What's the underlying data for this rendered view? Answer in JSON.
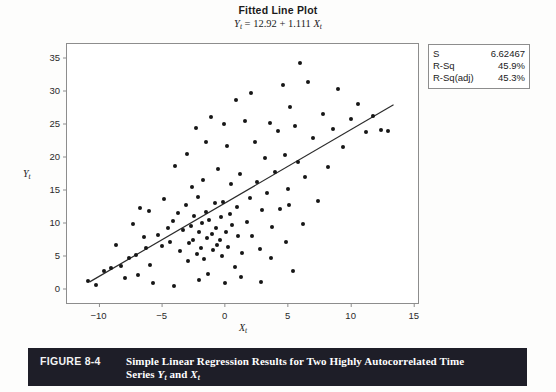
{
  "chart_data": {
    "type": "scatter",
    "title": "Fitted Line Plot",
    "subtitle_equation": "Yₜ = 12.92 + 1.111 Xₜ",
    "equation": {
      "intercept": 12.92,
      "slope": 1.111,
      "response": "Y",
      "predictor": "X",
      "subscript": "t"
    },
    "xlabel": "Xₜ",
    "ylabel": "Yₜ",
    "xlim": [
      -12.5,
      15.5
    ],
    "ylim": [
      -2.5,
      37.0
    ],
    "xticks": [
      -10,
      -5,
      0,
      5,
      10,
      15
    ],
    "yticks": [
      0,
      5,
      10,
      15,
      20,
      25,
      30,
      35
    ],
    "grid": false,
    "legend": "none",
    "fit_line": {
      "x_start": -10.7,
      "y_start": 1.0,
      "x_end": 13.4,
      "y_end": 27.8
    },
    "points": [
      [
        -10.8,
        1.1
      ],
      [
        -10.2,
        0.6
      ],
      [
        -9.6,
        2.6
      ],
      [
        -9.0,
        3.1
      ],
      [
        -8.6,
        6.6
      ],
      [
        -8.2,
        3.4
      ],
      [
        -7.6,
        4.6
      ],
      [
        -7.3,
        9.7
      ],
      [
        -7.0,
        5.1
      ],
      [
        -6.7,
        12.2
      ],
      [
        -6.4,
        7.8
      ],
      [
        -6.2,
        6.2
      ],
      [
        -6.0,
        11.8
      ],
      [
        -5.7,
        0.8
      ],
      [
        -5.3,
        8.1
      ],
      [
        -5.0,
        6.4
      ],
      [
        -4.8,
        13.5
      ],
      [
        -4.5,
        9.2
      ],
      [
        -4.3,
        7.1
      ],
      [
        -4.1,
        10.2
      ],
      [
        -3.9,
        18.6
      ],
      [
        -3.7,
        11.4
      ],
      [
        -3.5,
        5.6
      ],
      [
        -3.3,
        8.8
      ],
      [
        -3.1,
        12.6
      ],
      [
        -3.0,
        20.4
      ],
      [
        -2.9,
        4.1
      ],
      [
        -2.8,
        6.9
      ],
      [
        -2.7,
        9.4
      ],
      [
        -2.6,
        15.3
      ],
      [
        -2.5,
        7.3
      ],
      [
        -2.4,
        11.0
      ],
      [
        -2.3,
        24.3
      ],
      [
        -2.2,
        5.2
      ],
      [
        -2.1,
        13.8
      ],
      [
        -2.0,
        8.5
      ],
      [
        -1.9,
        6.1
      ],
      [
        -1.8,
        9.9
      ],
      [
        -1.7,
        16.4
      ],
      [
        -1.6,
        4.4
      ],
      [
        -1.5,
        11.6
      ],
      [
        -1.4,
        7.6
      ],
      [
        -1.3,
        2.2
      ],
      [
        -1.2,
        10.4
      ],
      [
        -1.1,
        26.0
      ],
      [
        -1.0,
        8.2
      ],
      [
        -0.9,
        5.8
      ],
      [
        -0.8,
        12.9
      ],
      [
        -0.7,
        9.1
      ],
      [
        -0.6,
        6.6
      ],
      [
        -0.5,
        18.1
      ],
      [
        -0.4,
        7.4
      ],
      [
        -0.3,
        10.8
      ],
      [
        -0.2,
        4.9
      ],
      [
        -0.1,
        13.1
      ],
      [
        0.1,
        8.6
      ],
      [
        0.2,
        21.6
      ],
      [
        0.3,
        6.3
      ],
      [
        0.4,
        11.3
      ],
      [
        0.5,
        15.8
      ],
      [
        0.6,
        9.6
      ],
      [
        0.8,
        3.2
      ],
      [
        1.0,
        12.4
      ],
      [
        1.1,
        7.9
      ],
      [
        1.2,
        17.3
      ],
      [
        1.4,
        5.4
      ],
      [
        1.6,
        25.3
      ],
      [
        1.8,
        10.1
      ],
      [
        2.0,
        13.7
      ],
      [
        2.2,
        8.0
      ],
      [
        2.4,
        22.1
      ],
      [
        2.6,
        16.1
      ],
      [
        2.8,
        6.0
      ],
      [
        3.0,
        11.9
      ],
      [
        3.2,
        19.8
      ],
      [
        3.4,
        14.4
      ],
      [
        3.6,
        25.1
      ],
      [
        3.8,
        9.3
      ],
      [
        4.0,
        17.6
      ],
      [
        4.2,
        23.9
      ],
      [
        4.4,
        12.1
      ],
      [
        4.6,
        30.8
      ],
      [
        4.8,
        20.2
      ],
      [
        5.0,
        15.1
      ],
      [
        5.2,
        27.4
      ],
      [
        5.4,
        2.7
      ],
      [
        5.6,
        24.6
      ],
      [
        5.8,
        19.1
      ],
      [
        6.0,
        34.2
      ],
      [
        6.2,
        9.8
      ],
      [
        6.4,
        16.8
      ],
      [
        6.6,
        31.2
      ],
      [
        7.0,
        22.8
      ],
      [
        7.4,
        13.2
      ],
      [
        7.8,
        26.4
      ],
      [
        8.2,
        18.4
      ],
      [
        8.6,
        24.1
      ],
      [
        9.0,
        30.2
      ],
      [
        9.4,
        21.4
      ],
      [
        10.0,
        25.6
      ],
      [
        10.6,
        27.9
      ],
      [
        11.2,
        23.7
      ],
      [
        11.8,
        26.1
      ],
      [
        12.4,
        24.0
      ],
      [
        13.0,
        23.8
      ],
      [
        -7.9,
        1.6
      ],
      [
        -5.9,
        3.6
      ],
      [
        -4.0,
        0.4
      ],
      [
        -2.0,
        1.3
      ],
      [
        0.0,
        0.9
      ],
      [
        1.3,
        1.8
      ],
      [
        2.9,
        1.0
      ],
      [
        4.9,
        7.1
      ],
      [
        -6.9,
        2.0
      ],
      [
        3.7,
        4.6
      ],
      [
        -1.45,
        22.2
      ],
      [
        0.9,
        28.6
      ],
      [
        2.1,
        29.6
      ],
      [
        -0.05,
        24.9
      ],
      [
        5.1,
        12.7
      ]
    ]
  },
  "stats_box": {
    "rows": [
      {
        "label": "S",
        "value": "6.62467"
      },
      {
        "label": "R-Sq",
        "value": "45.9%"
      },
      {
        "label": "R-Sq(adj)",
        "value": "45.3%"
      }
    ]
  },
  "caption": {
    "number": "FIGURE 8-4",
    "line1_a": "Simple Linear Regression Results for Two Highly Autocorrelated Time",
    "line2_a": "Series ",
    "line2_y": "Y",
    "line2_mid": " and ",
    "line2_x": "X",
    "sub": "t"
  },
  "colors": {
    "point": "#161616",
    "line": "#2b2b2b",
    "frame": "#8d8d8d",
    "caption_bg": "#1e1e28",
    "caption_text": "#ffffff",
    "page_bg": "#fdfdfc"
  }
}
